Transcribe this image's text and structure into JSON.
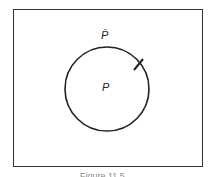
{
  "diagram": {
    "type": "venn",
    "universe_label": "",
    "outside_label": "P̄",
    "inside_label": "P",
    "caption": "Figure 11.5",
    "colors": {
      "stroke": "#222222",
      "background": "#ffffff"
    }
  }
}
